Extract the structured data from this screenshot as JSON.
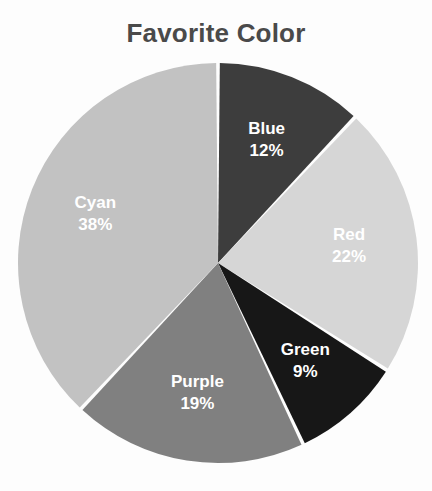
{
  "chart_data": {
    "type": "pie",
    "title": "Favorite Color",
    "xlabel": "",
    "ylabel": "",
    "legend_position": "none",
    "labels_on_slices": true,
    "value_format": "percent",
    "categories": [
      "Blue",
      "Red",
      "Green",
      "Purple",
      "Cyan"
    ],
    "values": [
      12,
      22,
      9,
      19,
      38
    ],
    "value_labels": [
      "12%",
      "22%",
      "9%",
      "19%",
      "38%"
    ],
    "slice_colors": [
      "#3d3d3d",
      "#d6d6d6",
      "#171717",
      "#808080",
      "#c2c2c2"
    ],
    "label_text_color": "#ffffff",
    "separator_color": "#ffffff",
    "start_angle_deg": 0,
    "direction": "clockwise",
    "slices": [
      {
        "label": "Blue",
        "value": 12,
        "value_label": "12%",
        "color": "#3d3d3d"
      },
      {
        "label": "Red",
        "value": 22,
        "value_label": "22%",
        "color": "#d6d6d6"
      },
      {
        "label": "Green",
        "value": 9,
        "value_label": "9%",
        "color": "#171717"
      },
      {
        "label": "Purple",
        "value": 19,
        "value_label": "19%",
        "color": "#808080"
      },
      {
        "label": "Cyan",
        "value": 38,
        "value_label": "38%",
        "color": "#c2c2c2"
      }
    ]
  },
  "title": {
    "text": "Favorite Color",
    "color": "#4a4a4a"
  },
  "geometry": {
    "center_x": 218,
    "center_y": 263,
    "radius": 200
  }
}
